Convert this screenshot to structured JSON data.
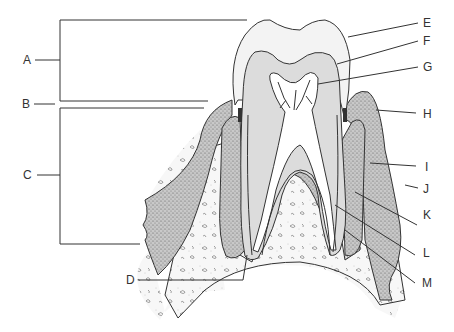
{
  "diagram": {
    "colors": {
      "enamel": "#f3f3f3",
      "dentin": "#dcdcdc",
      "pulp": "#ffffff",
      "gum": "#b8b8b8",
      "bone": "#f6f6f6",
      "outline": "#333333",
      "cementum_dark": "#444444"
    },
    "labels": {
      "A": "A",
      "B": "B",
      "C": "C",
      "D": "D",
      "E": "E",
      "F": "F",
      "G": "G",
      "H": "H",
      "I": "I",
      "J": "J",
      "K": "K",
      "L": "L",
      "M": "M"
    },
    "brackets": [
      {
        "label": "A",
        "region": "crown",
        "y_range": [
          20,
          101
        ]
      },
      {
        "label": "B",
        "region": "neck",
        "y": 104
      },
      {
        "label": "C",
        "region": "root",
        "y_range": [
          108,
          244
        ]
      }
    ]
  }
}
